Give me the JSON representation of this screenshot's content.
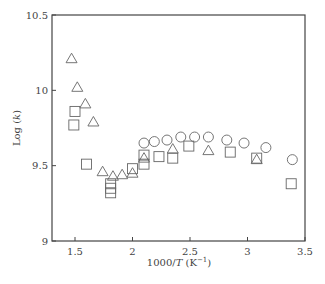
{
  "chart_data": {
    "type": "scatter",
    "title": "",
    "xlabel": "1000/T (K⁻¹)",
    "xlabel_parts": {
      "pre": "1000/",
      "italic": "T",
      "post": " (K",
      "sup": "−1",
      "close": ")"
    },
    "ylabel": "Log (k)",
    "ylabel_parts": {
      "pre": "Log (",
      "italic": "k",
      "post": ")"
    },
    "xlim": [
      1.3,
      3.5
    ],
    "ylim": [
      9,
      10.5
    ],
    "xticks": [
      1.5,
      2,
      2.5,
      3,
      3.5
    ],
    "xtick_labels": [
      "1.5",
      "2",
      "2.5",
      "3",
      "3.5"
    ],
    "yticks": [
      9,
      9.5,
      10,
      10.5
    ],
    "ytick_labels": [
      "9",
      "9.5",
      "10",
      "10.5"
    ],
    "grid": false,
    "legend": "none",
    "series": [
      {
        "name": "triangles",
        "marker": "triangle",
        "points": [
          [
            1.47,
            10.21
          ],
          [
            1.52,
            10.02
          ],
          [
            1.59,
            9.91
          ],
          [
            1.66,
            9.79
          ],
          [
            1.74,
            9.46
          ],
          [
            1.83,
            9.43
          ],
          [
            1.91,
            9.44
          ],
          [
            2.0,
            9.45
          ],
          [
            2.1,
            9.55
          ],
          [
            2.35,
            9.61
          ],
          [
            2.66,
            9.6
          ],
          [
            3.08,
            9.54
          ]
        ]
      },
      {
        "name": "squares",
        "marker": "square",
        "points": [
          [
            1.5,
            9.86
          ],
          [
            1.49,
            9.77
          ],
          [
            1.6,
            9.51
          ],
          [
            1.81,
            9.38
          ],
          [
            1.81,
            9.35
          ],
          [
            1.81,
            9.32
          ],
          [
            2.0,
            9.48
          ],
          [
            2.1,
            9.51
          ],
          [
            2.1,
            9.57
          ],
          [
            2.23,
            9.56
          ],
          [
            2.35,
            9.55
          ],
          [
            2.49,
            9.63
          ],
          [
            2.85,
            9.59
          ],
          [
            3.08,
            9.55
          ],
          [
            3.38,
            9.38
          ]
        ]
      },
      {
        "name": "circles",
        "marker": "circle",
        "points": [
          [
            2.1,
            9.65
          ],
          [
            2.19,
            9.66
          ],
          [
            2.3,
            9.67
          ],
          [
            2.42,
            9.69
          ],
          [
            2.54,
            9.69
          ],
          [
            2.66,
            9.69
          ],
          [
            2.82,
            9.67
          ],
          [
            2.97,
            9.65
          ],
          [
            3.16,
            9.62
          ],
          [
            3.39,
            9.54
          ]
        ]
      }
    ]
  },
  "style": {
    "axis_color": "#444444",
    "marker_color": "#666666"
  }
}
